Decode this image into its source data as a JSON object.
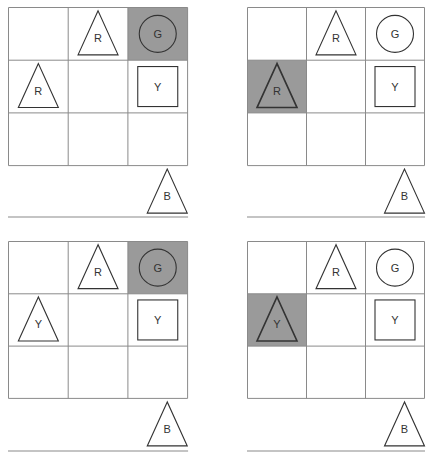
{
  "colors": {
    "grid_line": "#8a8a8a",
    "highlight": "#9a9a9a",
    "shape_stroke": "#333333",
    "baseline": "#8a8a8a"
  },
  "panels": [
    {
      "id": "top-left",
      "x": 8,
      "y": 7,
      "cell_w": 59.7,
      "cell_h": 52.7,
      "baseline_y": 210,
      "highlight": [
        0,
        2
      ],
      "cells": [
        {
          "row": 0,
          "col": 1,
          "shape": "triangle",
          "label": "R"
        },
        {
          "row": 0,
          "col": 2,
          "shape": "circle",
          "label": "G"
        },
        {
          "row": 1,
          "col": 0,
          "shape": "triangle",
          "label": "R"
        },
        {
          "row": 1,
          "col": 2,
          "shape": "square",
          "label": "Y"
        }
      ],
      "held": {
        "shape": "triangle",
        "label": "B"
      }
    },
    {
      "id": "top-right",
      "x": 247,
      "y": 7,
      "cell_w": 59,
      "cell_h": 52.7,
      "baseline_y": 210,
      "highlight": [
        1,
        0
      ],
      "cells": [
        {
          "row": 0,
          "col": 1,
          "shape": "triangle",
          "label": "R"
        },
        {
          "row": 0,
          "col": 2,
          "shape": "circle",
          "label": "G"
        },
        {
          "row": 1,
          "col": 0,
          "shape": "triangle",
          "label": "R",
          "bold": true
        },
        {
          "row": 1,
          "col": 2,
          "shape": "square",
          "label": "Y"
        }
      ],
      "held": {
        "shape": "triangle",
        "label": "B"
      }
    },
    {
      "id": "bottom-left",
      "x": 8,
      "y": 241,
      "cell_w": 59.7,
      "cell_h": 52.3,
      "baseline_y": 210,
      "highlight": [
        0,
        2
      ],
      "cells": [
        {
          "row": 0,
          "col": 1,
          "shape": "triangle",
          "label": "R"
        },
        {
          "row": 0,
          "col": 2,
          "shape": "circle",
          "label": "G"
        },
        {
          "row": 1,
          "col": 0,
          "shape": "triangle",
          "label": "Y"
        },
        {
          "row": 1,
          "col": 2,
          "shape": "square",
          "label": "Y"
        }
      ],
      "held": {
        "shape": "triangle",
        "label": "B"
      }
    },
    {
      "id": "bottom-right",
      "x": 247,
      "y": 241,
      "cell_w": 59,
      "cell_h": 52.3,
      "baseline_y": 210,
      "highlight": [
        1,
        0
      ],
      "cells": [
        {
          "row": 0,
          "col": 1,
          "shape": "triangle",
          "label": "R"
        },
        {
          "row": 0,
          "col": 2,
          "shape": "circle",
          "label": "G"
        },
        {
          "row": 1,
          "col": 0,
          "shape": "triangle",
          "label": "Y",
          "bold": true
        },
        {
          "row": 1,
          "col": 2,
          "shape": "square",
          "label": "Y"
        }
      ],
      "held": {
        "shape": "triangle",
        "label": "B"
      }
    }
  ]
}
